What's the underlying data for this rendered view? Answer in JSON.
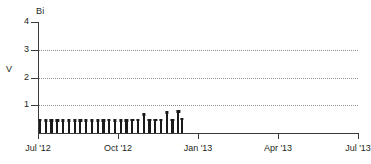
{
  "chart_data": {
    "type": "bar",
    "title": "Bi",
    "xlabel": "",
    "ylabel": "V",
    "ylim": [
      0,
      4
    ],
    "y_ticks": [
      1,
      2,
      3,
      4
    ],
    "y_tick_labels": [
      "1",
      "2",
      "3",
      "4"
    ],
    "gridlines_y": [
      1,
      2,
      3
    ],
    "grid": "horizontal-dotted",
    "legend": "none",
    "x_ticks": [
      "Jul '12",
      "Oct '12",
      "Jan '13",
      "Apr '13",
      "Jul '13"
    ],
    "x_tick_positions": [
      0,
      0.25,
      0.5,
      0.75,
      1.0
    ],
    "xlim_labels": [
      "Jul '12",
      "Jul '13"
    ],
    "series": [
      {
        "name": "Bi",
        "color": "#1a1a1a",
        "x": [
          0.003,
          0.021,
          0.039,
          0.057,
          0.075,
          0.093,
          0.111,
          0.129,
          0.147,
          0.165,
          0.183,
          0.201,
          0.219,
          0.237,
          0.255,
          0.273,
          0.291,
          0.309,
          0.327,
          0.345,
          0.363,
          0.381,
          0.399,
          0.417,
          0.435,
          0.446
        ],
        "values": [
          0.52,
          0.5,
          0.5,
          0.5,
          0.5,
          0.5,
          0.5,
          0.5,
          0.5,
          0.5,
          0.5,
          0.5,
          0.52,
          0.5,
          0.5,
          0.5,
          0.52,
          0.52,
          0.72,
          0.52,
          0.52,
          0.52,
          0.78,
          0.52,
          0.82,
          0.55
        ]
      }
    ]
  },
  "colors": {
    "axis": "#3a3a3a",
    "grid": "#8d8d8d",
    "marker": "#1a1a1a",
    "text": "#231f20",
    "background": "#ffffff"
  }
}
